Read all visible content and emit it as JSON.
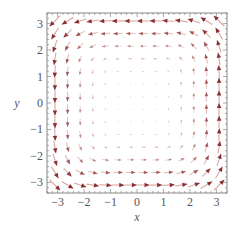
{
  "chart_data": {
    "type": "vector_field",
    "title": "",
    "xlabel": "x",
    "ylabel": "y",
    "xlim": [
      -3.4,
      3.4
    ],
    "ylim": [
      -3.4,
      3.4
    ],
    "xticks": [
      -3,
      -2,
      -1,
      0,
      1,
      2,
      3
    ],
    "yticks": [
      -3,
      -2,
      -1,
      0,
      1,
      2,
      3
    ],
    "xtick_labels": [
      "−3",
      "−2",
      "−1",
      "0",
      "1",
      "2",
      "3"
    ],
    "ytick_labels": [
      "−3",
      "−2",
      "−1",
      "0",
      "1",
      "2",
      "3"
    ],
    "grid": false,
    "field": "(-y^3, x^3)",
    "rotation": "counterclockwise",
    "sample_points_per_axis": 14,
    "sample_range": [
      -3.1,
      3.1
    ],
    "frame": true,
    "colors": {
      "arrow_head": "#8a2f2f",
      "arrow_tail": "#d8a6a6",
      "frame": "#888888",
      "text": "#555555"
    }
  }
}
